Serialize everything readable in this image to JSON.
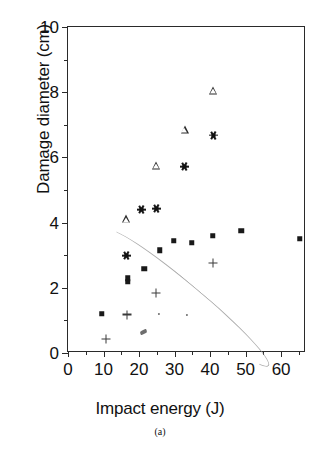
{
  "figure": {
    "caption": "(a)",
    "background": "#ffffff",
    "ink_color": "#191919"
  },
  "chart_data": {
    "type": "scatter",
    "title": "",
    "xlabel": "Impact energy (J)",
    "ylabel": "Damage diameter (cm)",
    "xlim": [
      0,
      67
    ],
    "ylim": [
      0,
      10
    ],
    "xticks": [
      0,
      10,
      20,
      30,
      40,
      50,
      60
    ],
    "xticklabels": [
      "0",
      "10",
      "20",
      "30",
      "40",
      "50",
      "60"
    ],
    "xminorticks": [
      5,
      15,
      25,
      35,
      45,
      55,
      65
    ],
    "yticks": [
      0,
      2,
      4,
      6,
      8,
      10
    ],
    "yticklabels": [
      "0",
      "2",
      "4",
      "6",
      "8",
      "10"
    ],
    "yminorticks": [
      1,
      3,
      5,
      7,
      9
    ],
    "grid": false,
    "legend": false,
    "legend_position": "none",
    "series": [
      {
        "name": "filled-square",
        "marker": "square",
        "marker_style": "filled",
        "color": "#191919",
        "points": [
          {
            "x": 9.5,
            "y": 1.2
          },
          {
            "x": 16.8,
            "y": 2.3
          },
          {
            "x": 16.8,
            "y": 2.18
          },
          {
            "x": 21.5,
            "y": 2.58
          },
          {
            "x": 25.8,
            "y": 3.15
          },
          {
            "x": 29.8,
            "y": 3.45
          },
          {
            "x": 34.8,
            "y": 3.38
          },
          {
            "x": 40.8,
            "y": 3.6
          },
          {
            "x": 48.8,
            "y": 3.75
          },
          {
            "x": 65.2,
            "y": 3.5
          }
        ]
      },
      {
        "name": "open-triangle",
        "marker": "triangle",
        "marker_style": "open",
        "color": "#2b2b2b",
        "points": [
          {
            "x": 16.4,
            "y": 4.1
          },
          {
            "x": 24.7,
            "y": 5.75
          },
          {
            "x": 32.8,
            "y": 6.85
          },
          {
            "x": 40.9,
            "y": 8.05
          }
        ]
      },
      {
        "name": "asterisk",
        "marker": "asterisk",
        "marker_style": "filled",
        "color": "#191919",
        "points": [
          {
            "x": 16.6,
            "y": 2.98
          },
          {
            "x": 20.8,
            "y": 4.4
          },
          {
            "x": 24.8,
            "y": 4.42
          },
          {
            "x": 32.8,
            "y": 5.72
          },
          {
            "x": 40.9,
            "y": 6.68
          }
        ]
      },
      {
        "name": "plus",
        "marker": "plus",
        "marker_style": "open",
        "color": "#3a3a3a",
        "points": [
          {
            "x": 10.8,
            "y": 0.42
          },
          {
            "x": 16.7,
            "y": 1.18
          },
          {
            "x": 24.8,
            "y": 1.83
          },
          {
            "x": 40.8,
            "y": 2.75
          }
        ]
      },
      {
        "name": "small-dot",
        "marker": "dot",
        "marker_style": "filled",
        "color": "#6a6a6a",
        "points": [
          {
            "x": 25.7,
            "y": 1.2
          },
          {
            "x": 33.5,
            "y": 1.18
          }
        ]
      }
    ],
    "artifacts": [
      {
        "name": "scan-arc",
        "cx": 33.5,
        "cy": 1.72,
        "rx": 3.4,
        "ry": 3.2
      },
      {
        "name": "scan-smudge",
        "x": 20.2,
        "y": 0.72
      }
    ]
  }
}
